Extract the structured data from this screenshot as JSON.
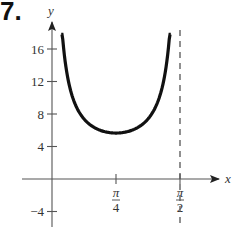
{
  "problem": {
    "number": "7."
  },
  "chart_data": {
    "type": "line",
    "title": "",
    "xlabel": "x",
    "ylabel": "y",
    "function_description": "U-shaped curve on (0, π/2) with vertical asymptotes at x=0 and x=π/2, minimum at x=π/4",
    "series": [
      {
        "name": "f(x)",
        "x": [
          0.113,
          0.15,
          0.2,
          0.3,
          0.4,
          0.5,
          0.6,
          0.7,
          0.7854,
          0.9,
          1.0,
          1.1,
          1.2,
          1.3,
          1.4,
          1.45,
          1.458
        ],
        "y": [
          17.8,
          15.5,
          12.2,
          9.0,
          7.4,
          6.6,
          6.0,
          5.75,
          5.66,
          5.8,
          6.2,
          6.8,
          7.8,
          9.5,
          12.5,
          15.5,
          17.8
        ]
      }
    ],
    "asymptotes": [
      {
        "type": "vertical",
        "x": 1.5708,
        "label": "π/2",
        "style": "dashed"
      }
    ],
    "x_ticks": [
      {
        "value": 0.7854,
        "label_num": "π",
        "label_den": "4"
      },
      {
        "value": 1.5708,
        "label_num": "π",
        "label_den": "2"
      }
    ],
    "y_ticks": [
      {
        "value": -4,
        "label": "−4"
      },
      {
        "value": 4,
        "label": "4"
      },
      {
        "value": 8,
        "label": "8"
      },
      {
        "value": 12,
        "label": "12"
      },
      {
        "value": 16,
        "label": "16"
      }
    ],
    "xlim": [
      -0.3,
      1.95
    ],
    "ylim": [
      -5.5,
      20
    ],
    "grid": false,
    "legend": null
  }
}
